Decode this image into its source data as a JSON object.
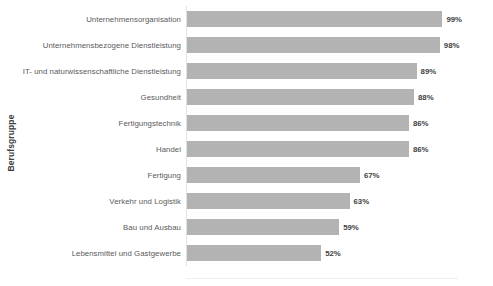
{
  "chart_data": {
    "type": "bar",
    "orientation": "horizontal",
    "title": "",
    "xlabel": "",
    "ylabel": "Berufsgruppe",
    "xlim": [
      0,
      100
    ],
    "unit": "%",
    "grid": false,
    "legend": "none",
    "value_labels": true,
    "bar_color": "#b3b3b3",
    "categories": [
      "Unternehmensorganisation",
      "Unternehmensbezogene Dienstleistung",
      "IT- und naturwissenschaftliche Dienstleistung",
      "Gesundheit",
      "Fertigungstechnik",
      "Handel",
      "Fertigung",
      "Verkehr und Logistik",
      "Bau und Ausbau",
      "Lebensmittel und Gastgewerbe"
    ],
    "values": [
      99,
      98,
      89,
      88,
      86,
      86,
      67,
      63,
      59,
      52
    ],
    "value_labels_text": [
      "99%",
      "98%",
      "89%",
      "88%",
      "86%",
      "86%",
      "67%",
      "63%",
      "59%",
      "52%"
    ]
  }
}
